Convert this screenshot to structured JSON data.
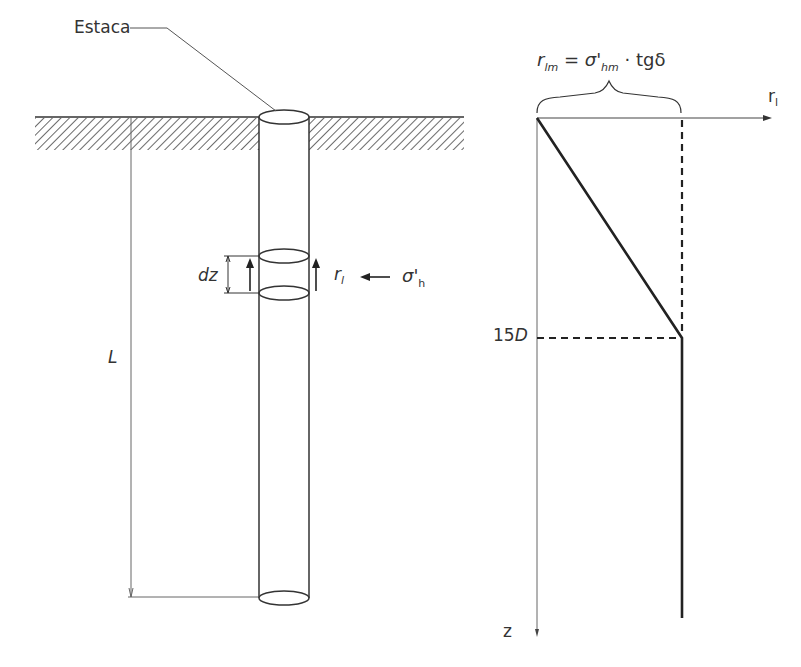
{
  "left_diagram": {
    "pile_label": "Estaca",
    "length_label": "L",
    "slice_label": "dz",
    "shaft_resistance_label": "r",
    "shaft_resistance_sub": "l",
    "horizontal_stress_label": "σ'",
    "horizontal_stress_sub": "h"
  },
  "right_diagram": {
    "formula": {
      "lhs": "r",
      "lhs_sub": "lm",
      "eq": " = ",
      "sigma": "σ'",
      "sigma_sub": "hm",
      "rest": " · tgδ"
    },
    "x_axis_label": "r",
    "x_axis_sub": "l",
    "z_axis_label": "z",
    "critical_depth_label": "15",
    "critical_depth_unit": "D"
  },
  "colors": {
    "line": "#333333",
    "thin_line": "#666666",
    "background": "#ffffff"
  }
}
